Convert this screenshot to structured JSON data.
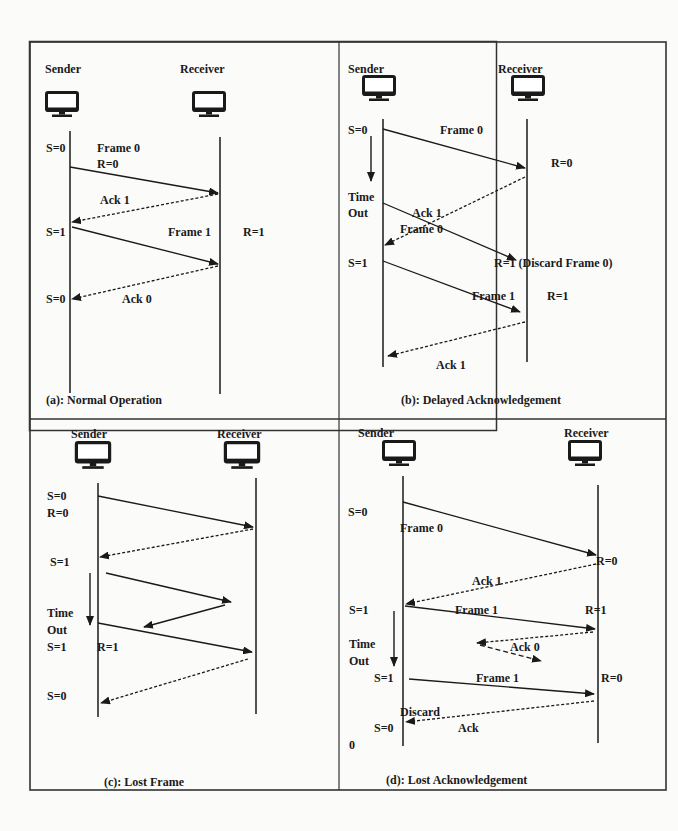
{
  "figure": {
    "panels": [
      {
        "id": "a",
        "caption": "(a): Normal Operation",
        "sender_label": "Sender",
        "receiver_label": "Receiver",
        "labels": [
          "S=0",
          "Frame 0",
          "R=0",
          "Ack 1",
          "S=1",
          "Frame 1",
          "R=1",
          "S=0",
          "Ack 0"
        ]
      },
      {
        "id": "b",
        "caption": "(b): Delayed Acknowledgement",
        "sender_label": "Sender",
        "receiver_label": "Receiver",
        "labels": [
          "S=0",
          "Frame 0",
          "R=0",
          "Time",
          "Out",
          "Ack 1",
          "Frame 0",
          "S=1",
          "R=1 (Discard Frame 0)",
          "Frame 1",
          "R=1",
          "Ack 1"
        ]
      },
      {
        "id": "c",
        "caption": "(c): Lost Frame",
        "sender_label": "Sender",
        "receiver_label": "Receiver",
        "labels": [
          "S=0",
          "R=0",
          "S=1",
          "Time",
          "Out",
          "S=1",
          "R=1",
          "S=0"
        ]
      },
      {
        "id": "d",
        "caption": "(d): Lost Acknowledgement",
        "sender_label": "Sender",
        "receiver_label": "Receiver",
        "labels": [
          "S=0",
          "Frame 0",
          "R=0",
          "Ack 1",
          "S=1",
          "Frame 1",
          "R=1",
          "Time",
          "Out",
          "Ack 0",
          "S=1",
          "Frame 1",
          "R=0",
          "Discard",
          "S=0",
          "Ack",
          "0"
        ]
      }
    ]
  }
}
